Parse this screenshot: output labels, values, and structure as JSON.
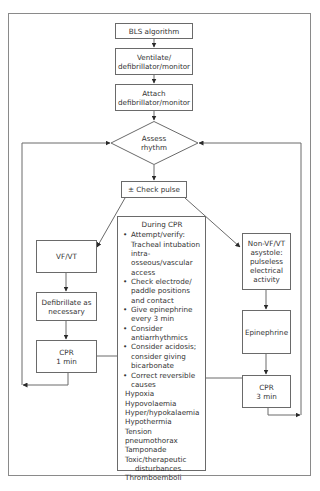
{
  "diagram": {
    "type": "flowchart",
    "colors": {
      "line": "#6a6a6a",
      "text": "#333333",
      "background": "#ffffff"
    },
    "nodes": {
      "bls": {
        "lines": [
          "BLS algorithm"
        ]
      },
      "ventilate": {
        "lines": [
          "Ventilate/",
          "defibrillator/monitor"
        ]
      },
      "attach": {
        "lines": [
          "Attach",
          "defibrillator/monitor"
        ]
      },
      "assess": {
        "shape": "diamond",
        "lines": [
          "Assess",
          "rhythm"
        ]
      },
      "check_pulse": {
        "lines": [
          "± Check pulse"
        ]
      },
      "vfvt": {
        "lines": [
          "VF/VT"
        ]
      },
      "defibrillate": {
        "lines": [
          "Defibrillate as",
          "necessary"
        ]
      },
      "cpr1": {
        "lines": [
          "CPR",
          "1 min"
        ]
      },
      "nonvf": {
        "lines": [
          "Non-VF/VT",
          "asystole:",
          "pulseless",
          "electrical",
          "activity"
        ]
      },
      "epinephrine": {
        "lines": [
          "Epinephrine"
        ]
      },
      "cpr3": {
        "lines": [
          "CPR",
          "3 min"
        ]
      }
    },
    "during_cpr": {
      "title": "During CPR",
      "bullet_glyph": "•",
      "bullets": [
        {
          "lines": [
            "Attempt/verify:",
            "Tracheal intubation",
            "intra-osseous/vascular",
            "access"
          ]
        },
        {
          "lines": [
            "Check electrode/",
            "paddle positions",
            "and contact"
          ]
        },
        {
          "lines": [
            "Give epinephrine",
            "every 3 min"
          ]
        },
        {
          "lines": [
            "Consider",
            "antiarrhythmics"
          ]
        },
        {
          "lines": [
            "Consider acidosis;",
            "consider giving",
            "bicarbonate"
          ]
        },
        {
          "lines": [
            "Correct reversible",
            "causes"
          ]
        }
      ],
      "causes": [
        "Hypoxia",
        "Hypovolaemia",
        "Hyper/hypokalaemia",
        "Hypothermia",
        "Tension pneumothorax",
        "Tamponade",
        "Toxic/therapeutic",
        "disturbances",
        "Thromboemboli"
      ]
    },
    "edges": [
      "bls -> ventilate",
      "ventilate -> attach",
      "attach -> assess",
      "assess -> check_pulse",
      "check_pulse -> vfvt",
      "check_pulse -> nonvf",
      "vfvt -> defibrillate",
      "defibrillate -> cpr1",
      "cpr1 -> assess (loop left)",
      "nonvf -> epinephrine",
      "epinephrine -> cpr3",
      "cpr3 -> assess (loop right)",
      "cpr1 — during_cpr",
      "cpr3 — during_cpr"
    ]
  }
}
